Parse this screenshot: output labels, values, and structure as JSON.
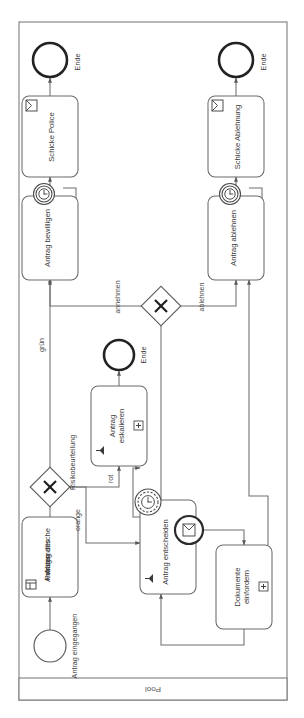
{
  "diagram": {
    "type": "bpmn-process",
    "orientation": "rotated-90-ccw",
    "pool": {
      "label": "Pool"
    },
    "events": [
      {
        "id": "start",
        "name": "Antrag eingegangen",
        "kind": "start-none"
      },
      {
        "id": "end_police",
        "name": "Ende",
        "kind": "end-none"
      },
      {
        "id": "end_ablehnung",
        "name": "Ende",
        "kind": "end-none"
      },
      {
        "id": "end_eskalation",
        "name": "Ende",
        "kind": "end-none"
      }
    ],
    "tasks": [
      {
        "id": "t_pruefung",
        "name": "Automatische Prüfung des Antrags",
        "kind": "business-rule-task",
        "icon": "table-icon"
      },
      {
        "id": "t_entscheiden",
        "name": "Antrag entscheiden",
        "kind": "user-task",
        "icon": "user-icon"
      },
      {
        "id": "t_eskalieren",
        "name": "Antrag eskalieren",
        "kind": "user-task-subprocess",
        "icon": "user-icon",
        "marker": "plus-marker"
      },
      {
        "id": "t_dokumente",
        "name": "Dokumente einfordern",
        "kind": "collapsed-subprocess",
        "marker": "plus-marker"
      },
      {
        "id": "t_bewilligen",
        "name": "Antrag bewilligen",
        "kind": "task"
      },
      {
        "id": "t_ablehnen",
        "name": "Antrag ablehnen",
        "kind": "task"
      },
      {
        "id": "t_police",
        "name": "Schicke Police",
        "kind": "send-task",
        "icon": "envelope-icon"
      },
      {
        "id": "t_ablehnung",
        "name": "Schicke Ablehnung",
        "kind": "send-task",
        "icon": "envelope-icon"
      }
    ],
    "gateways": [
      {
        "id": "gw_risiko",
        "name": "Risikobeurteilung",
        "kind": "exclusive"
      },
      {
        "id": "gw_entscheid",
        "name": "",
        "kind": "exclusive"
      }
    ],
    "boundary_events": [
      {
        "id": "be_entscheiden_timer",
        "attached_to": "t_entscheiden",
        "kind": "timer-non-interrupting",
        "icon": "clock-icon"
      },
      {
        "id": "be_entscheiden_msg",
        "attached_to": "t_entscheiden",
        "kind": "message-interrupting",
        "icon": "envelope-icon"
      },
      {
        "id": "be_bewilligen_timer",
        "attached_to": "t_bewilligen",
        "kind": "timer-non-interrupting",
        "icon": "clock-icon"
      },
      {
        "id": "be_ablehnen_timer",
        "attached_to": "t_ablehnen",
        "kind": "timer-non-interrupting",
        "icon": "clock-icon"
      }
    ],
    "flow_labels": [
      {
        "id": "fl_gruen",
        "text": "grün"
      },
      {
        "id": "fl_orange",
        "text": "orange"
      },
      {
        "id": "fl_rot",
        "text": "rot"
      },
      {
        "id": "fl_annehmen",
        "text": "annehmen"
      },
      {
        "id": "fl_ablehnen",
        "text": "ablehnen"
      }
    ]
  },
  "labels": {
    "pool": "Pool",
    "start_event": "Antrag eingegangen",
    "end_police": "Ende",
    "end_ablehnung": "Ende",
    "end_eskalation": "Ende",
    "task_pruefung": "Automatische Prüfung des Antrags",
    "task_pruefung_l1": "Automatische",
    "task_pruefung_l2": "Prüfung des",
    "task_pruefung_l3": "Antrags",
    "task_entscheiden": "Antrag entscheiden",
    "task_eskalieren_l1": "Antrag",
    "task_eskalieren_l2": "eskalieren",
    "task_dokumente_l1": "Dokumente",
    "task_dokumente_l2": "einfordern",
    "task_bewilligen": "Antrag bewilligen",
    "task_ablehnen": "Antrag ablehnen",
    "task_police": "Schicke Police",
    "task_ablehnung": "Schicke Ablehnung",
    "gw_risiko": "Risikobeurteilung",
    "flow_gruen": "grün",
    "flow_orange": "orange",
    "flow_rot": "rot",
    "flow_annehmen": "annehmen",
    "flow_ablehnen": "ablehnen"
  },
  "colors": {
    "background": "#ffffff",
    "pool_border": "#7d7d7d",
    "shape_border": "#6b6b6b",
    "flow_line": "#6e6e6e",
    "text": "#3a3a3a",
    "end_event_border": "#222222"
  }
}
